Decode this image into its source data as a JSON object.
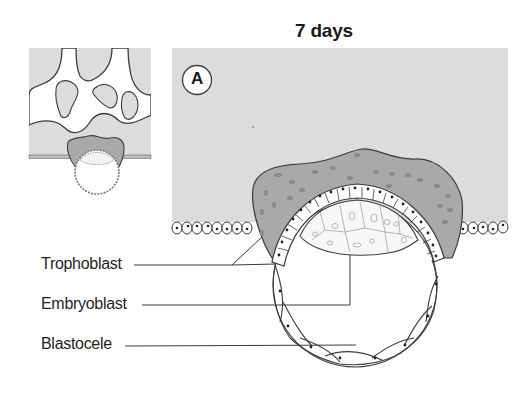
{
  "figure": {
    "title": "7 days",
    "panel_label": "A",
    "labels": {
      "trophoblast": "Trophoblast",
      "embryoblast": "Embryoblast",
      "blastocele": "Blastocele"
    }
  },
  "colors": {
    "endometrium": "#dcdcdc",
    "syncytiotrophoblast": "#a9a9a9",
    "outline": "#3c3c3c",
    "background": "#ffffff"
  }
}
